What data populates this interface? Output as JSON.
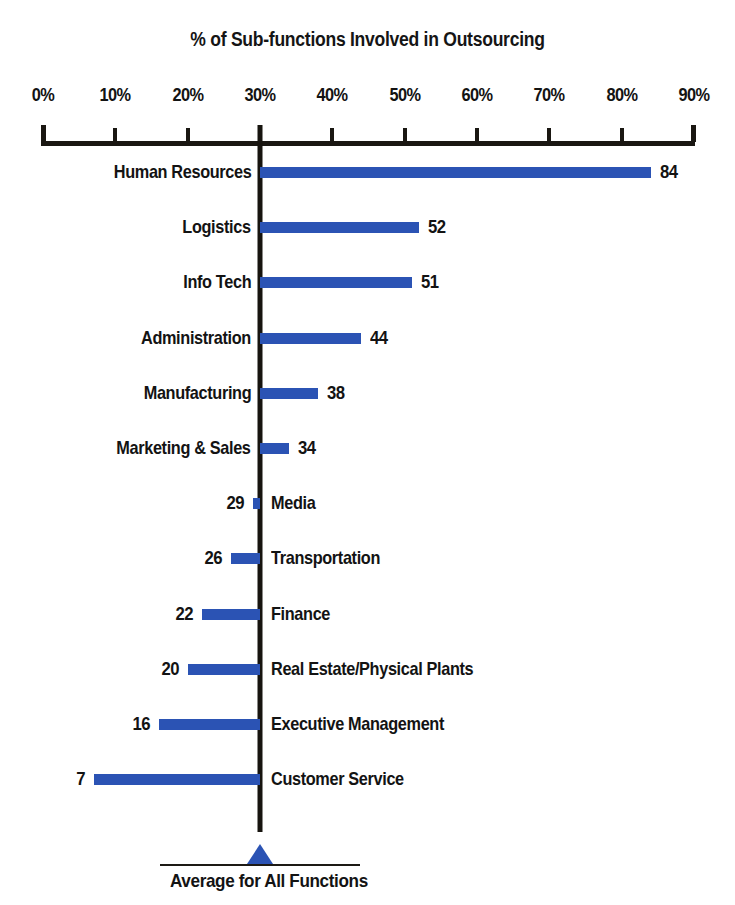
{
  "chart_data": {
    "type": "bar",
    "title": "% of Sub-functions Involved in Outsourcing",
    "xlabel": "",
    "ylabel": "",
    "orientation": "horizontal",
    "baseline_value": 30,
    "xlim": [
      0,
      90
    ],
    "grid": false,
    "legend": null,
    "tick_labels": [
      "0%",
      "10%",
      "20%",
      "30%",
      "40%",
      "50%",
      "60%",
      "70%",
      "80%",
      "90%"
    ],
    "tick_values": [
      0,
      10,
      20,
      30,
      40,
      50,
      60,
      70,
      80,
      90
    ],
    "bar_color": "#2B53B4",
    "axis_color": "#1A1712",
    "categories": [
      "Human Resources",
      "Logistics",
      "Info Tech",
      "Administration",
      "Manufacturing",
      "Marketing & Sales",
      "Media",
      "Transportation",
      "Finance",
      "Real Estate/Physical Plants",
      "Executive Management",
      "Customer Service"
    ],
    "values": [
      84,
      52,
      51,
      44,
      38,
      34,
      29,
      26,
      22,
      20,
      16,
      7
    ],
    "value_labels": [
      "84",
      "52",
      "51",
      "44",
      "38",
      "34",
      "29",
      "26",
      "22",
      "20",
      "16",
      "7"
    ],
    "annotation": {
      "marker": "triangle-up",
      "marker_value": 30,
      "caption": "Average for All Functions"
    }
  }
}
